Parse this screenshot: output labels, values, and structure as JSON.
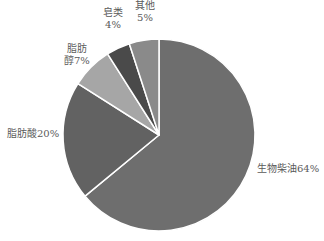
{
  "chart_data": {
    "type": "pie",
    "title": "",
    "start_angle_deg": 90,
    "direction": "clockwise",
    "slices": [
      {
        "label": "生物柴油",
        "value": 64,
        "label_text": "生物柴油64%",
        "color": "#6e6e6e"
      },
      {
        "label": "脂肪酸",
        "value": 20,
        "label_text": "脂肪酸20%",
        "color": "#626262"
      },
      {
        "label": "脂肪醇",
        "value": 7,
        "label_text": "脂肪醇7%",
        "color": "#a6a6a6"
      },
      {
        "label": "皂类",
        "value": 4,
        "label_text": "皂类4%",
        "color": "#4a4a4a"
      },
      {
        "label": "其他",
        "value": 5,
        "label_text": "其他5%",
        "color": "#8a8a8a"
      }
    ],
    "legend": "none"
  },
  "labels": {
    "biodiesel": "生物柴油64%",
    "fatty_acid": "脂肪酸20%",
    "fatty_alcohol_line1": "脂肪",
    "fatty_alcohol_line2": "醇7%",
    "soap_line1": "皂类",
    "soap_line2": "4%",
    "other_line1": "其他",
    "other_line2": "5%"
  }
}
